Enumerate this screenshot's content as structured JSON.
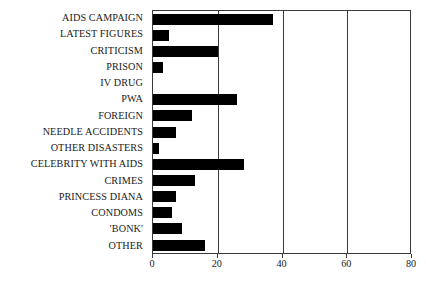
{
  "chart_data": {
    "type": "bar",
    "orientation": "horizontal",
    "title": "",
    "subtitle": "",
    "xlabel": "",
    "ylabel": "",
    "xlim": [
      0,
      80
    ],
    "ylim": null,
    "grid": true,
    "gridlines_x": [
      20,
      40,
      60
    ],
    "legend": null,
    "legend_position": "none",
    "xticks": [
      0,
      20,
      40,
      60,
      80
    ],
    "xtick_labels": [
      "0",
      "20",
      "40",
      "60",
      "80"
    ],
    "bar_color": "#000000",
    "axis_color": "#3a3a3a",
    "background_color": "#ffffff",
    "categories": [
      "AIDS CAMPAIGN",
      "LATEST FIGURES",
      "CRITICISM",
      "PRISON",
      "IV DRUG",
      "PWA",
      "FOREIGN",
      "NEEDLE ACCIDENTS",
      "OTHER DISASTERS",
      "CELEBRITY WITH AIDS",
      "CRIMES",
      "PRINCESS DIANA",
      "CONDOMS",
      "'BONK'",
      "OTHER"
    ],
    "values": [
      37,
      5,
      20,
      3,
      0,
      26,
      12,
      7,
      2,
      28,
      13,
      7,
      6,
      9,
      16
    ]
  }
}
